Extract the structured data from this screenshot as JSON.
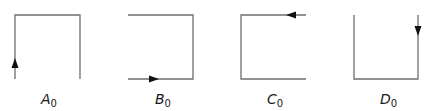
{
  "diagram": {
    "panels": [
      {
        "id": "A",
        "label": "A",
        "subscript": "0",
        "open_side": "bottom-right",
        "arrow": "up on left edge"
      },
      {
        "id": "B",
        "label": "B",
        "subscript": "0",
        "open_side": "left",
        "arrow": "right on bottom edge"
      },
      {
        "id": "C",
        "label": "C",
        "subscript": "0",
        "open_side": "right",
        "arrow": "left on top edge"
      },
      {
        "id": "D",
        "label": "D",
        "subscript": "0",
        "open_side": "top",
        "arrow": "down on right edge"
      }
    ],
    "colors": {
      "line": "#6f6f6f",
      "arrow": "#111111",
      "text": "#1a1a1a",
      "background": "#ffffff"
    }
  }
}
